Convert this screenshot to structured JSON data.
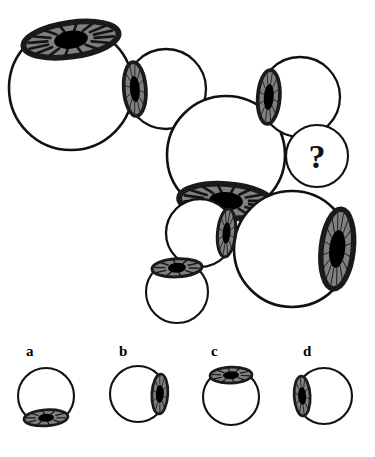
{
  "puzzle": {
    "type": "visual-analogy-sequence",
    "title": "Eyeball rotation sequence puzzle",
    "question_marker": "?",
    "colors": {
      "outline": "#111111",
      "sclera": "#ffffff",
      "iris": "#808080",
      "iris_rim": "#1a1a1a",
      "pupil": "#000000",
      "background": "#ffffff"
    },
    "sequence": [
      {
        "id": "eye-1",
        "order": 1,
        "size": "large",
        "radius": 62,
        "cx": 71,
        "cy": 88,
        "iris_position": "top",
        "iris_rx": 48,
        "iris_ry": 17,
        "pupil_rx": 17,
        "pupil_ry": 9,
        "rotation": -8,
        "has_iris": true
      },
      {
        "id": "eye-2",
        "order": 2,
        "size": "medium",
        "radius": 40,
        "cx": 166,
        "cy": 89,
        "iris_position": "left",
        "iris_rx": 11,
        "iris_ry": 27,
        "pupil_rx": 5,
        "pupil_ry": 13,
        "rotation": -4,
        "has_iris": true
      },
      {
        "id": "eye-3",
        "order": 3,
        "size": "large",
        "radius": 59,
        "cx": 226,
        "cy": 155,
        "iris_position": "bottom",
        "iris_rx": 47,
        "iris_ry": 17,
        "pupil_rx": 17,
        "pupil_ry": 9,
        "rotation": 4,
        "has_iris": true
      },
      {
        "id": "eye-4",
        "order": 4,
        "size": "medium",
        "radius": 40,
        "cx": 300,
        "cy": 97,
        "iris_position": "left",
        "iris_rx": 11,
        "iris_ry": 27,
        "pupil_rx": 5,
        "pupil_ry": 13,
        "rotation": 4,
        "has_iris": true
      },
      {
        "id": "eye-unknown",
        "order": 5,
        "size": "small",
        "radius": 31,
        "cx": 317,
        "cy": 156,
        "iris_position": "unknown",
        "has_iris": false,
        "is_question": true
      },
      {
        "id": "eye-6",
        "order": 6,
        "size": "large",
        "radius": 58,
        "cx": 292,
        "cy": 249,
        "iris_position": "right",
        "iris_rx": 16,
        "iris_ry": 40,
        "pupil_rx": 8,
        "pupil_ry": 19,
        "rotation": 6,
        "has_iris": true
      },
      {
        "id": "eye-7",
        "order": 7,
        "size": "small",
        "radius": 34,
        "cx": 200,
        "cy": 233,
        "iris_position": "right",
        "iris_rx": 9,
        "iris_ry": 24,
        "pupil_rx": 4,
        "pupil_ry": 11,
        "rotation": 5,
        "has_iris": true
      },
      {
        "id": "eye-8",
        "order": 8,
        "size": "small",
        "radius": 31,
        "cx": 177,
        "cy": 292,
        "iris_position": "top",
        "iris_rx": 25,
        "iris_ry": 9,
        "pupil_rx": 9,
        "pupil_ry": 5,
        "rotation": -3,
        "has_iris": true
      }
    ],
    "options": [
      {
        "id": "option-a",
        "label": "a",
        "label_x": 26,
        "label_y": 356,
        "cx": 46,
        "cy": 396,
        "radius": 28,
        "iris_position": "bottom",
        "iris_rx": 22,
        "iris_ry": 8,
        "pupil_rx": 8,
        "pupil_ry": 4,
        "rotation": -4,
        "has_iris": true
      },
      {
        "id": "option-b",
        "label": "b",
        "label_x": 119,
        "label_y": 356,
        "cx": 138,
        "cy": 394,
        "radius": 28,
        "iris_position": "right",
        "iris_rx": 8,
        "iris_ry": 20,
        "pupil_rx": 4,
        "pupil_ry": 9,
        "rotation": 3,
        "has_iris": true
      },
      {
        "id": "option-c",
        "label": "c",
        "label_x": 211,
        "label_y": 356,
        "cx": 231,
        "cy": 397,
        "radius": 28,
        "iris_position": "top",
        "iris_rx": 21,
        "iris_ry": 8,
        "pupil_rx": 8,
        "pupil_ry": 4,
        "rotation": -2,
        "has_iris": true
      },
      {
        "id": "option-d",
        "label": "d",
        "label_x": 303,
        "label_y": 356,
        "cx": 324,
        "cy": 396,
        "radius": 28,
        "iris_position": "left",
        "iris_rx": 8,
        "iris_ry": 20,
        "pupil_rx": 4,
        "pupil_ry": 9,
        "rotation": -3,
        "has_iris": true
      }
    ]
  }
}
